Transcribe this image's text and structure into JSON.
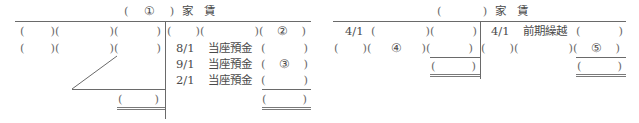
{
  "accounts": [
    {
      "title": {
        "open": "(",
        "blank": "①",
        "close": ")",
        "name": "家　賃"
      },
      "debit": {
        "rows": [
          {
            "date": "",
            "account": "",
            "amount": ""
          },
          {
            "date": "",
            "account": "",
            "amount": ""
          }
        ],
        "total": ""
      },
      "credit": {
        "rows": [
          {
            "date": "",
            "account": "",
            "amount": "②"
          },
          {
            "date": "8/1",
            "account": "当座預金",
            "amount": ""
          },
          {
            "date": "9/1",
            "account": "当座預金",
            "amount": "③"
          },
          {
            "date": "2/1",
            "account": "当座預金",
            "amount": ""
          }
        ],
        "total": ""
      }
    },
    {
      "title": {
        "open": "(",
        "blank": "",
        "close": ")",
        "name": "家　賃"
      },
      "debit": {
        "rows": [
          {
            "date": "4/1",
            "account": "",
            "amount": ""
          },
          {
            "date": "",
            "account": "④",
            "amount": ""
          }
        ],
        "total": ""
      },
      "credit": {
        "rows": [
          {
            "date": "4/1",
            "account": "前期繰越",
            "amount": ""
          },
          {
            "date": "",
            "account": "",
            "amount": "⑤"
          }
        ],
        "total": ""
      }
    }
  ],
  "symbols": {
    "open": "(",
    "close": ")"
  }
}
